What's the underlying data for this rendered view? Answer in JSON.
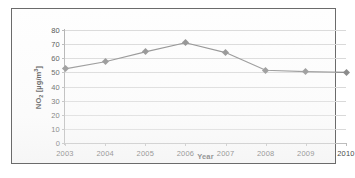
{
  "chart_data": {
    "type": "line",
    "title": "",
    "xlabel": "Year",
    "ylabel": "NO2 [µg/m³]",
    "ylabel_parts": {
      "base": "NO",
      "sub": "2",
      "units_open": " [µg/m",
      "sup": "3",
      "units_close": "]"
    },
    "categories": [
      "2003",
      "2004",
      "2005",
      "2006",
      "2007",
      "2008",
      "2009",
      "2010"
    ],
    "x": [
      2003,
      2004,
      2005,
      2006,
      2007,
      2008,
      2009,
      2010
    ],
    "values": [
      52.5,
      57.5,
      64.5,
      71,
      64,
      51.5,
      50.5,
      50
    ],
    "series": [
      {
        "name": "NO2 annual mean",
        "values": [
          52.5,
          57.5,
          64.5,
          71,
          64,
          51.5,
          50.5,
          50
        ],
        "color": "#8c8c8c",
        "marker": "diamond"
      }
    ],
    "ylim": [
      0,
      80
    ],
    "ytick_step": 10,
    "yticks": [
      0,
      10,
      20,
      30,
      40,
      50,
      60,
      70,
      80
    ],
    "ytick_labels": [
      "0",
      "10",
      "20",
      "30",
      "40",
      "50",
      "60",
      "70",
      "80"
    ],
    "xticks": [
      2003,
      2004,
      2005,
      2006,
      2007,
      2008,
      2009,
      2010
    ],
    "xtick_labels": [
      "2003",
      "2004",
      "2005",
      "2006",
      "2007",
      "2008",
      "2009",
      "2010"
    ],
    "grid": true,
    "grid_axis": "y",
    "legend": false,
    "legend_position": "none",
    "plot_background": "#ffffff",
    "grid_color": "#d9d9d9",
    "axis_color": "#b0b0b0",
    "text_color": "#4a4a4a"
  },
  "figure": {
    "border_color": "#6b6b6b",
    "background": "#ffffff"
  }
}
